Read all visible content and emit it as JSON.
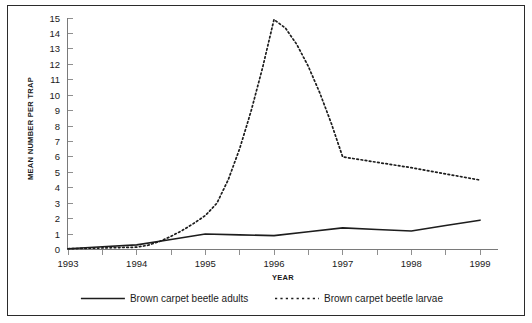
{
  "chart_data": {
    "type": "line",
    "title": "",
    "xlabel": "YEAR",
    "ylabel": "MEAN NUMBER PER TRAP",
    "categories": [
      "1993",
      "1994",
      "1995",
      "1996",
      "1997",
      "1998",
      "1999"
    ],
    "xlim": [
      1993,
      1999
    ],
    "ylim": [
      0,
      15
    ],
    "yticks": [
      0,
      1,
      2,
      3,
      4,
      5,
      6,
      7,
      8,
      9,
      10,
      11,
      12,
      13,
      14,
      15
    ],
    "grid": false,
    "legend_position": "bottom",
    "series": [
      {
        "name": "Brown carpet beetle adults",
        "style": "solid",
        "color": "#1d1d1d",
        "values": [
          0.05,
          0.3,
          1.0,
          0.9,
          1.4,
          1.2,
          1.9
        ]
      },
      {
        "name": "Brown carpet beetle larvae",
        "style": "dotted",
        "color": "#1d1d1d",
        "values": [
          0.05,
          0.15,
          2.2,
          14.9,
          6.0,
          5.3,
          4.5
        ]
      }
    ]
  },
  "axes": {
    "y_tick_labels": [
      "15",
      "14",
      "13",
      "12",
      "11",
      "10",
      "9",
      "8",
      "7",
      "6",
      "5",
      "4",
      "3",
      "2",
      "1",
      "0"
    ],
    "x_tick_labels": [
      "1993",
      "1994",
      "1995",
      "1996",
      "1997",
      "1998",
      "1999"
    ],
    "y_axis_title": "MEAN NUMBER PER TRAP",
    "x_axis_title": "YEAR"
  },
  "legend": {
    "items": [
      {
        "label": "Brown carpet beetle adults",
        "style": "solid"
      },
      {
        "label": "Brown carpet beetle larvae",
        "style": "dotted"
      }
    ]
  }
}
